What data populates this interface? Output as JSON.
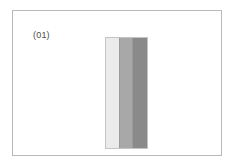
{
  "figure": {
    "label": "(01)",
    "background_color": "#ffffff",
    "frame_border_color": "#b9b9b9",
    "label_color": "#4a4a4a"
  },
  "layer_stack": {
    "name": "three-band-vertical-bar",
    "outline_color": "#c4c4c4",
    "divider_color": "#9a9a9a",
    "bands": [
      {
        "name": "light-band",
        "color": "#ebebeb",
        "width_pct": 33
      },
      {
        "name": "medium-band",
        "color": "#a8a8a8",
        "width_pct": 31
      },
      {
        "name": "dark-band",
        "color": "#8a8a8a",
        "width_pct": 36
      }
    ]
  }
}
